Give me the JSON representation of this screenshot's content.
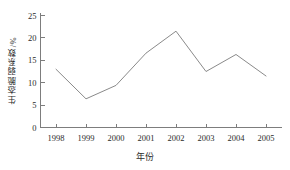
{
  "chart_data": {
    "type": "line",
    "title": "",
    "xlabel": "年份",
    "ylabel": "生态脆弱系数/%",
    "categories": [
      "1998",
      "1999",
      "2000",
      "2001",
      "2002",
      "2003",
      "2004",
      "2005"
    ],
    "values": [
      13.0,
      6.4,
      9.4,
      16.6,
      21.5,
      12.5,
      16.3,
      11.5
    ],
    "series": [
      {
        "name": "生态脆弱系数",
        "values": [
          13.0,
          6.4,
          9.4,
          16.6,
          21.5,
          12.5,
          16.3,
          11.5
        ]
      }
    ],
    "ylim": [
      0,
      25
    ],
    "yticks": [
      "0",
      "5",
      "10",
      "15",
      "20",
      "25"
    ],
    "ytick_values": [
      0,
      5,
      10,
      15,
      20,
      25
    ],
    "xticks": [
      "1998",
      "1999",
      "2000",
      "2001",
      "2002",
      "2003",
      "2004",
      "2005"
    ],
    "grid": false,
    "legend": false,
    "legend_position": "none",
    "line_color": "#8a8a8a",
    "axis_color": "#7d7d7d",
    "background_color": "#ffffff"
  }
}
